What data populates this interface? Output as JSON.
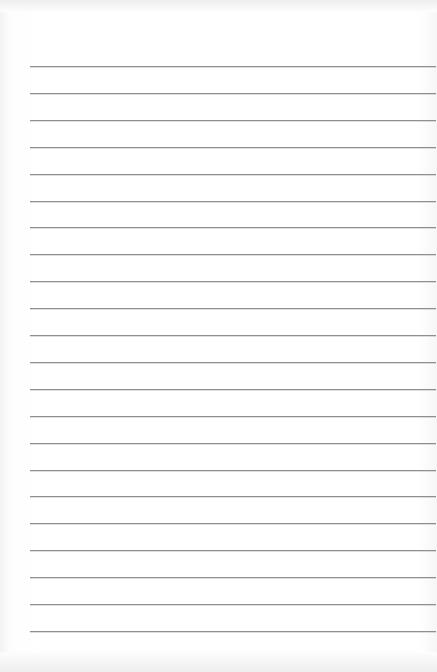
{
  "page": {
    "type": "lined-paper",
    "background_color": "#ffffff",
    "line_color": "#8f8f8f",
    "line_count": 22,
    "first_line_y": 66,
    "line_spacing": 26.9,
    "line_left": 30,
    "line_right": 436
  }
}
